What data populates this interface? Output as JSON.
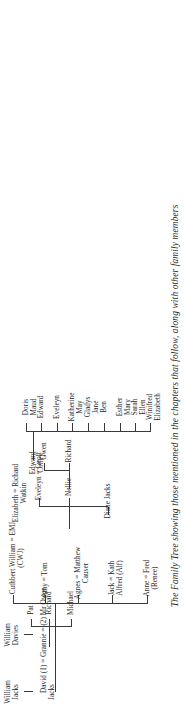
{
  "diagram": {
    "kind": "family-tree",
    "orientation": "rotated-90-ccw",
    "caption": "The Family Tree showing those mentioned in the chapters that follow, along with other family members",
    "line_color": "#3a3a3a",
    "text_color": "#1f1f1f",
    "background": "#ffffff"
  },
  "generation1": {
    "william_jacks": {
      "line1": "William",
      "line2": "Jacks"
    },
    "william_davies": {
      "line1": "William",
      "line2": "Davies"
    }
  },
  "generation2": {
    "marriage_line": "David (1) = Grannie = (2) Mr Owen",
    "david_surname": "Jacks",
    "elizabeth": {
      "line1": "Elizabeth = Richard",
      "line2": "Watkin",
      "line3": "Edward",
      "line4": "Colley"
    }
  },
  "generation3_owen_children": [
    {
      "line1": "Anne = Fred",
      "line2": "(Renee)"
    },
    {
      "line1": "Jack = Kath",
      "line2": "Alfred (Alf)"
    },
    {
      "line1": "Agnes = Matthew",
      "line2": "Causer"
    },
    {
      "line1": "Amy = Tom",
      "line2": ""
    },
    {
      "line1": "Cuthbert William = EMJ",
      "line2": "(CWJ)"
    }
  ],
  "generation3_watkin_children": [
    {
      "line1": "Winifred",
      "line2": "Elizabeth"
    },
    {
      "line1": "Sarah",
      "line2": "Ellen"
    },
    {
      "line1": "Esther",
      "line2": "Mary"
    },
    {
      "line1": "Ben",
      "line2": ""
    },
    {
      "line1": "Gladys",
      "line2": "Jane"
    },
    {
      "line1": "Katherine",
      "line2": "May"
    },
    {
      "line1": "Eveleyn",
      "line2": ""
    },
    {
      "line1": "Edward",
      "line2": ""
    },
    {
      "line1": "Doris",
      "line2": "Maud"
    }
  ],
  "generation4_causer_children": [
    {
      "line1": "Michael",
      "line2": ""
    },
    {
      "line1": "Richard",
      "line2": ""
    },
    {
      "line1": "Pat",
      "line2": ""
    }
  ],
  "generation4_cwj_children": [
    {
      "line1": "Diane Jacks",
      "line2": ""
    },
    {
      "line1": "Nellie",
      "line2": ""
    },
    {
      "line1": "Eveleyn = Geoff",
      "line2": ""
    }
  ],
  "generation5_nellie_children": [
    {
      "line1": "Richard",
      "line2": ""
    },
    {
      "line1": "Gwen",
      "line2": ""
    }
  ]
}
